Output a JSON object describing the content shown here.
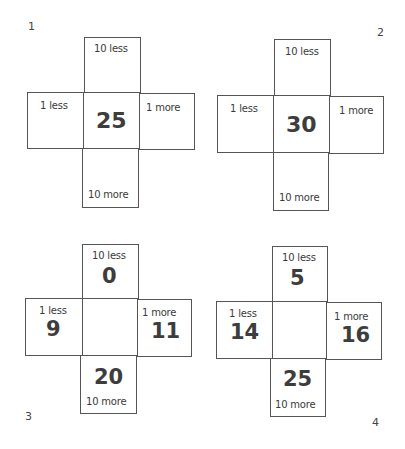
{
  "puzzles": [
    {
      "number": "1",
      "center": "25",
      "top": {
        "label": "10 less",
        "value": ""
      },
      "left": {
        "label": "1 less",
        "value": ""
      },
      "right": {
        "label": "1 more",
        "value": ""
      },
      "bottom": {
        "label": "10 more",
        "value": ""
      }
    },
    {
      "number": "2",
      "center": "30",
      "top": {
        "label": "10 less",
        "value": ""
      },
      "left": {
        "label": "1 less",
        "value": ""
      },
      "right": {
        "label": "1 more",
        "value": ""
      },
      "bottom": {
        "label": "10 more",
        "value": ""
      }
    },
    {
      "number": "3",
      "center": "",
      "top": {
        "label": "10 less",
        "value": "0"
      },
      "left": {
        "label": "1 less",
        "value": "9"
      },
      "right": {
        "label": "1 more",
        "value": "11"
      },
      "bottom": {
        "label": "10 more",
        "value": "20"
      }
    },
    {
      "number": "4",
      "center": "",
      "top": {
        "label": "10 less",
        "value": "5"
      },
      "left": {
        "label": "1 less",
        "value": "14"
      },
      "right": {
        "label": "1 more",
        "value": "16"
      },
      "bottom": {
        "label": "10 more",
        "value": "25"
      }
    }
  ]
}
